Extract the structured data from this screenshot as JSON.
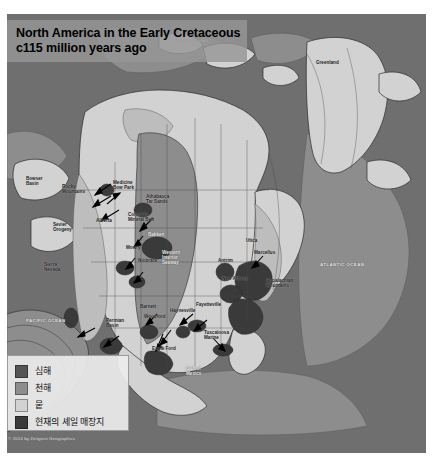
{
  "title": {
    "line1": "North America in the Early Cretaceous",
    "line2": "c115 million years ago"
  },
  "legend": {
    "items": [
      {
        "label": "심해",
        "color": "#555555",
        "meaning": "deep-sea"
      },
      {
        "label": "천해",
        "color": "#8d8d8d",
        "meaning": "shallow-sea"
      },
      {
        "label": "뭍",
        "color": "#d2d2d2",
        "meaning": "land"
      },
      {
        "label": "현재의 셰일 매장지",
        "color": "#3a3a3a",
        "meaning": "present-day-shale-deposits"
      }
    ]
  },
  "credit": "© 2014 by Zeitgeist Geographics",
  "map": {
    "projection_note": "North America, Early Cretaceous palaeogeography, grayscale",
    "colors": {
      "deep_sea": "#6f6f6f",
      "shallow_sea": "#8d8d8d",
      "land": "#d2d2d2",
      "land_highland": "#bdbdbd",
      "shale": "#3a3a3a",
      "coastline": "#2b2b2b",
      "border": "#4a4a4a",
      "banner": "#969696",
      "legend_bg": "#ececec"
    },
    "labels": [
      {
        "text": "Bowser\nBasin",
        "x": 26,
        "y": 176,
        "style": "dark"
      },
      {
        "text": "Rocky\nMountains",
        "x": 62,
        "y": 184,
        "style": "dark"
      },
      {
        "text": "Medicine\nBow Park",
        "x": 113,
        "y": 180,
        "style": "dark"
      },
      {
        "text": "Athabasca\nTar Sands",
        "x": 146,
        "y": 194,
        "style": "dark"
      },
      {
        "text": "Alberta",
        "x": 96,
        "y": 218,
        "style": "dark"
      },
      {
        "text": "Colorado\nMineral Belt",
        "x": 128,
        "y": 212,
        "style": "dark"
      },
      {
        "text": "Sevier\nOrogeny",
        "x": 53,
        "y": 222,
        "style": "dark"
      },
      {
        "text": "Bakken",
        "x": 148,
        "y": 232,
        "style": "light"
      },
      {
        "text": "Mowry",
        "x": 126,
        "y": 245,
        "style": "dark"
      },
      {
        "text": "Niobrara",
        "x": 138,
        "y": 258,
        "style": "dark"
      },
      {
        "text": "Sierra\nNevada",
        "x": 44,
        "y": 262,
        "style": "dark"
      },
      {
        "text": "Western\nInterior\nSeaway",
        "x": 162,
        "y": 250,
        "style": "light"
      },
      {
        "text": "Marcellus",
        "x": 254,
        "y": 250,
        "style": "dark"
      },
      {
        "text": "Utica",
        "x": 246,
        "y": 238,
        "style": "dark"
      },
      {
        "text": "Antrim",
        "x": 218,
        "y": 258,
        "style": "dark"
      },
      {
        "text": "New Albany",
        "x": 222,
        "y": 276,
        "style": "dark"
      },
      {
        "text": "Appalachian\nMountains",
        "x": 266,
        "y": 278,
        "style": "dark"
      },
      {
        "text": "Haynesville",
        "x": 170,
        "y": 308,
        "style": "dark"
      },
      {
        "text": "Fayetteville",
        "x": 196,
        "y": 302,
        "style": "dark"
      },
      {
        "text": "Barnett",
        "x": 140,
        "y": 304,
        "style": "dark"
      },
      {
        "text": "Woodford",
        "x": 144,
        "y": 314,
        "style": "dark"
      },
      {
        "text": "Permian\nBasin",
        "x": 106,
        "y": 318,
        "style": "dark"
      },
      {
        "text": "Eagle Ford",
        "x": 152,
        "y": 346,
        "style": "dark"
      },
      {
        "text": "Tuscaloosa\nMarine",
        "x": 204,
        "y": 330,
        "style": "dark"
      },
      {
        "text": "Gulf of\nMexico",
        "x": 186,
        "y": 366,
        "style": "light"
      },
      {
        "text": "PACIFIC OCEAN",
        "x": 26,
        "y": 318,
        "style": "ocean"
      },
      {
        "text": "ATLANTIC OCEAN",
        "x": 320,
        "y": 262,
        "style": "ocean"
      },
      {
        "text": "Greenland",
        "x": 316,
        "y": 60,
        "style": "dark"
      },
      {
        "text": "Arctic Ocean",
        "x": 176,
        "y": 38,
        "style": "ocean"
      }
    ],
    "arrows": [
      {
        "from": [
          104,
          170
        ],
        "to": [
          86,
          182
        ]
      },
      {
        "from": [
          104,
          182
        ],
        "to": [
          84,
          194
        ]
      },
      {
        "from": [
          112,
          196
        ],
        "to": [
          92,
          208
        ]
      },
      {
        "from": [
          100,
          188
        ],
        "to": [
          112,
          178
        ]
      },
      {
        "from": [
          146,
          204
        ],
        "to": [
          132,
          218
        ]
      },
      {
        "from": [
          136,
          222
        ],
        "to": [
          126,
          234
        ]
      },
      {
        "from": [
          128,
          244
        ],
        "to": [
          118,
          256
        ]
      },
      {
        "from": [
          136,
          258
        ],
        "to": [
          126,
          270
        ]
      },
      {
        "from": [
          256,
          244
        ],
        "to": [
          244,
          256
        ]
      },
      {
        "from": [
          150,
          300
        ],
        "to": [
          138,
          312
        ]
      },
      {
        "from": [
          186,
          300
        ],
        "to": [
          172,
          312
        ]
      },
      {
        "from": [
          200,
          306
        ],
        "to": [
          186,
          318
        ]
      },
      {
        "from": [
          164,
          316
        ],
        "to": [
          152,
          332
        ]
      },
      {
        "from": [
          156,
          320
        ],
        "to": [
          148,
          338
        ]
      },
      {
        "from": [
          206,
          324
        ],
        "to": [
          218,
          338
        ]
      },
      {
        "from": [
          112,
          322
        ],
        "to": [
          96,
          334
        ]
      },
      {
        "from": [
          88,
          314
        ],
        "to": [
          70,
          324
        ]
      }
    ]
  }
}
